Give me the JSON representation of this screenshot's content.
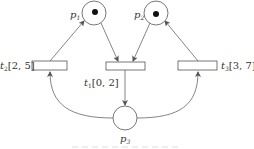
{
  "diagram": {
    "type": "time-petri-net",
    "colors": {
      "stroke": "#555555",
      "token": "#111111",
      "text": "#333333",
      "background": "#ffffff"
    },
    "places": [
      {
        "id": "p1",
        "label_main": "p",
        "label_sub": "1",
        "tokens": 1
      },
      {
        "id": "p2",
        "label_main": "p",
        "label_sub": "2",
        "tokens": 1
      },
      {
        "id": "p3",
        "label_main": "p",
        "label_sub": "3",
        "tokens": 0
      }
    ],
    "transitions": [
      {
        "id": "t1",
        "label_main": "t",
        "label_sub": "1",
        "interval": "[0, 2]"
      },
      {
        "id": "t2",
        "label_main": "t",
        "label_sub": "2",
        "interval": "[2, 5]"
      },
      {
        "id": "t3",
        "label_main": "t",
        "label_sub": "3",
        "interval": "[3, 7]"
      }
    ],
    "arcs": [
      {
        "from": "p1",
        "to": "t1"
      },
      {
        "from": "p2",
        "to": "t1"
      },
      {
        "from": "t1",
        "to": "p3"
      },
      {
        "from": "p3",
        "to": "t2"
      },
      {
        "from": "p3",
        "to": "t3"
      },
      {
        "from": "t2",
        "to": "p1"
      },
      {
        "from": "t3",
        "to": "p2"
      }
    ],
    "caption": "图 ..."
  }
}
